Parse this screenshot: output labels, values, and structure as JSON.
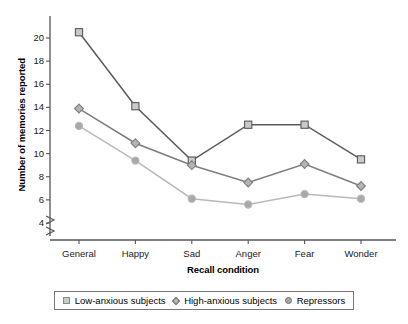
{
  "chart_data": {
    "type": "line",
    "title": "",
    "xlabel": "Recall condition",
    "ylabel": "Number of memories reported",
    "categories": [
      "General",
      "Happy",
      "Sad",
      "Anger",
      "Fear",
      "Wonder"
    ],
    "ylim": [
      4,
      21
    ],
    "yticks": [
      4,
      6,
      8,
      10,
      12,
      14,
      16,
      18,
      20
    ],
    "ytick_labels": [
      "4",
      "6",
      "8",
      "10",
      "12",
      "14",
      "16",
      "18",
      "20"
    ],
    "grid": false,
    "axis_break": true,
    "legend_position": "bottom",
    "series": [
      {
        "name": "Low-anxious subjects",
        "marker": "square",
        "color": "#5a5a5a",
        "marker_fill": "#c9c9c9",
        "values": [
          20.5,
          14.1,
          9.4,
          12.5,
          12.5,
          9.5
        ]
      },
      {
        "name": "High-anxious subjects",
        "marker": "diamond",
        "color": "#7d7d7d",
        "marker_fill": "#b4b4b4",
        "values": [
          13.9,
          10.9,
          9.0,
          7.5,
          9.1,
          7.2
        ]
      },
      {
        "name": "Repressors",
        "marker": "circle",
        "color": "#b9b9b9",
        "marker_fill": "#a8a8a8",
        "values": [
          12.4,
          9.4,
          6.1,
          5.6,
          6.5,
          6.1
        ]
      }
    ]
  },
  "legend": {
    "entries": [
      {
        "label": "Low-anxious subjects",
        "marker": "square"
      },
      {
        "label": "High-anxious subjects",
        "marker": "diamond"
      },
      {
        "label": "Repressors",
        "marker": "circle"
      }
    ]
  },
  "colors": {
    "axis": "#555555",
    "background": "#ffffff",
    "text": "#000000",
    "series_low_anxious": "#5a5a5a",
    "series_high_anxious": "#7d7d7d",
    "series_repressors": "#b9b9b9"
  }
}
